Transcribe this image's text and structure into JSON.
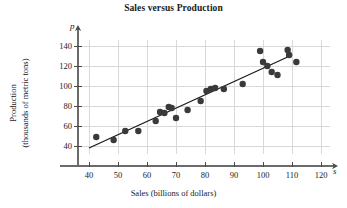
{
  "chart_data": {
    "type": "scatter",
    "title": "Sales versus Production",
    "xlabel": "Sales (billions of dollars)",
    "ylabel_line1": "Production",
    "ylabel_line2": "(thousands of metric tons)",
    "x_axis_variable": "s",
    "y_axis_variable": "p",
    "xlim": [
      35,
      125
    ],
    "ylim": [
      30,
      148
    ],
    "xticks": [
      40,
      50,
      60,
      70,
      80,
      90,
      100,
      110,
      120
    ],
    "yticks": [
      40,
      60,
      80,
      100,
      120,
      140
    ],
    "xtick_labels": [
      "40",
      "50",
      "60",
      "70",
      "80",
      "90",
      "100",
      "110",
      "120"
    ],
    "ytick_labels": [
      "40",
      "60",
      "80",
      "100",
      "120",
      "140"
    ],
    "grid": true,
    "grid_color": "#d9d9d9",
    "legend": null,
    "marker_color": "#3a3a3a",
    "marker_size": 3.2,
    "points": [
      {
        "x": 42.5,
        "y": 49
      },
      {
        "x": 48.5,
        "y": 46
      },
      {
        "x": 52.5,
        "y": 55
      },
      {
        "x": 57.0,
        "y": 55
      },
      {
        "x": 63.0,
        "y": 65
      },
      {
        "x": 64.5,
        "y": 74
      },
      {
        "x": 66.0,
        "y": 73
      },
      {
        "x": 67.5,
        "y": 79
      },
      {
        "x": 68.5,
        "y": 78
      },
      {
        "x": 70.0,
        "y": 68
      },
      {
        "x": 74.0,
        "y": 76
      },
      {
        "x": 78.5,
        "y": 85
      },
      {
        "x": 80.5,
        "y": 95
      },
      {
        "x": 82.0,
        "y": 97
      },
      {
        "x": 83.5,
        "y": 98
      },
      {
        "x": 86.5,
        "y": 97
      },
      {
        "x": 93.0,
        "y": 102
      },
      {
        "x": 99.0,
        "y": 135
      },
      {
        "x": 100.0,
        "y": 124
      },
      {
        "x": 101.5,
        "y": 120
      },
      {
        "x": 103.0,
        "y": 114
      },
      {
        "x": 105.0,
        "y": 111
      },
      {
        "x": 108.5,
        "y": 136
      },
      {
        "x": 109.0,
        "y": 131
      },
      {
        "x": 111.5,
        "y": 124
      }
    ],
    "trend_line": {
      "x_start": 40.0,
      "y_start": 38.0,
      "x_end": 110.0,
      "y_end": 131.0,
      "color": "#1a1a1a",
      "width": 1.3
    }
  }
}
